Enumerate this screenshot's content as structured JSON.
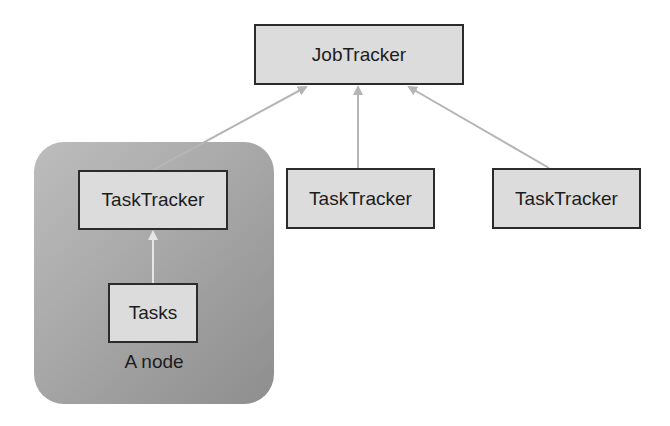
{
  "diagram": {
    "job_tracker": {
      "label": "JobTracker"
    },
    "task_trackers": [
      {
        "label": "TaskTracker"
      },
      {
        "label": "TaskTracker"
      },
      {
        "label": "TaskTracker"
      }
    ],
    "node": {
      "label": "A node",
      "tasks": {
        "label": "Tasks"
      }
    },
    "edges": [
      {
        "from": "Tasks",
        "to": "TaskTracker (node)"
      },
      {
        "from": "TaskTracker (node)",
        "to": "JobTracker"
      },
      {
        "from": "TaskTracker (middle)",
        "to": "JobTracker"
      },
      {
        "from": "TaskTracker (right)",
        "to": "JobTracker"
      }
    ],
    "colors": {
      "box_fill": "#dcdcdc",
      "box_border": "#2b2b2b",
      "node_fill": "#a8a8a8",
      "arrow": "#b5b5b5"
    }
  }
}
